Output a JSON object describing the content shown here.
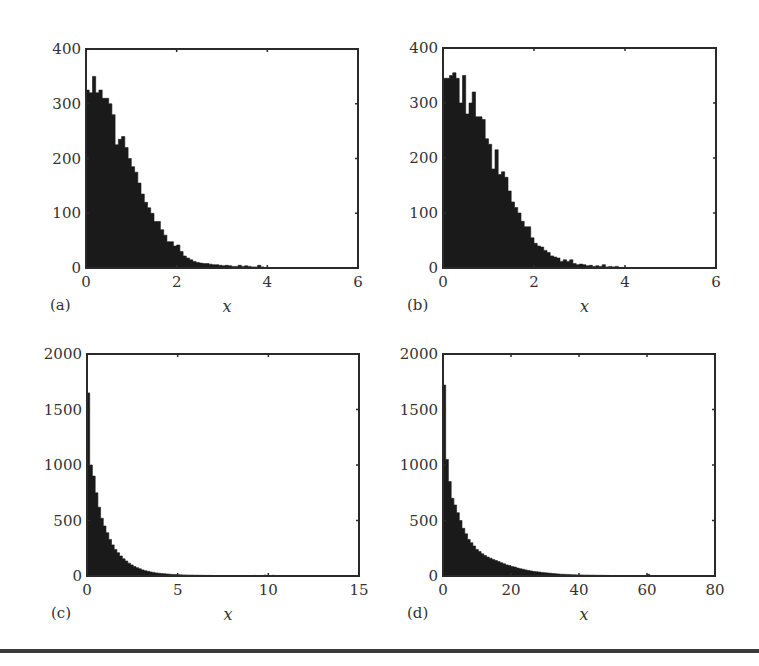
{
  "figure": {
    "bottom_rule_color": "#3a3a3a",
    "bar_color": "#1a1a1a"
  },
  "chart_data": [
    {
      "id": "a",
      "type": "bar",
      "panel_label": "(a)",
      "title": "",
      "xlabel": "x",
      "ylabel": "",
      "xlim": [
        0,
        6
      ],
      "ylim": [
        0,
        400
      ],
      "xticks": [
        "0",
        "2",
        "4",
        "6"
      ],
      "yticks": [
        "0",
        "100",
        "200",
        "300",
        "400"
      ],
      "grid": false,
      "bin_width": 0.0714,
      "bin_start": 0,
      "values": [
        325,
        320,
        350,
        320,
        325,
        310,
        310,
        300,
        280,
        225,
        235,
        240,
        220,
        200,
        185,
        175,
        155,
        135,
        120,
        110,
        100,
        85,
        85,
        70,
        60,
        48,
        48,
        40,
        42,
        30,
        22,
        18,
        15,
        12,
        10,
        9,
        8,
        8,
        7,
        6,
        6,
        5,
        4,
        5,
        4,
        3,
        3,
        5,
        3,
        4,
        3,
        2,
        2,
        5,
        2,
        1,
        1,
        1,
        1,
        0,
        0,
        0,
        0,
        0,
        0,
        0,
        0,
        0,
        0,
        0,
        0,
        0,
        0,
        0,
        0,
        0,
        0,
        0,
        0,
        0,
        0,
        0,
        0,
        0
      ]
    },
    {
      "id": "b",
      "type": "bar",
      "panel_label": "(b)",
      "title": "",
      "xlabel": "x",
      "ylabel": "",
      "xlim": [
        0,
        6
      ],
      "ylim": [
        0,
        400
      ],
      "xticks": [
        "0",
        "2",
        "4",
        "6"
      ],
      "yticks": [
        "0",
        "100",
        "200",
        "300",
        "400"
      ],
      "grid": false,
      "bin_width": 0.0714,
      "bin_start": 0,
      "values": [
        345,
        345,
        350,
        355,
        345,
        300,
        350,
        280,
        300,
        320,
        275,
        275,
        270,
        235,
        225,
        180,
        215,
        170,
        175,
        165,
        140,
        120,
        110,
        100,
        85,
        75,
        75,
        55,
        45,
        40,
        38,
        32,
        28,
        22,
        20,
        18,
        12,
        15,
        12,
        15,
        8,
        6,
        7,
        6,
        4,
        5,
        3,
        4,
        3,
        6,
        2,
        3,
        2,
        3,
        1,
        1,
        1,
        0,
        0,
        0,
        0,
        0,
        0,
        0,
        0,
        0,
        0,
        0,
        0,
        0,
        0,
        0,
        0,
        0,
        0,
        0,
        0,
        0,
        0,
        0,
        0,
        0,
        0,
        0
      ]
    },
    {
      "id": "c",
      "type": "bar",
      "panel_label": "(c)",
      "title": "",
      "xlabel": "x",
      "ylabel": "",
      "xlim": [
        0,
        15
      ],
      "ylim": [
        0,
        2000
      ],
      "xticks": [
        "0",
        "5",
        "10",
        "15"
      ],
      "yticks": [
        "0",
        "500",
        "1000",
        "1500",
        "2000"
      ],
      "grid": false,
      "bin_width": 0.15,
      "bin_start": 0,
      "values": [
        1650,
        1000,
        900,
        750,
        620,
        520,
        450,
        390,
        330,
        280,
        240,
        210,
        180,
        155,
        135,
        115,
        100,
        85,
        75,
        65,
        55,
        48,
        42,
        36,
        32,
        28,
        25,
        22,
        20,
        18,
        16,
        14,
        13,
        12,
        11,
        10,
        9,
        8,
        8,
        7,
        7,
        6,
        6,
        5,
        5,
        5,
        4,
        4,
        4,
        3,
        3,
        3,
        3,
        3,
        2,
        2,
        2,
        2,
        2,
        2,
        2,
        5,
        1,
        1,
        1,
        8,
        1,
        1,
        6,
        1,
        1,
        1,
        1,
        0,
        0,
        0,
        0,
        0,
        0,
        0,
        0,
        0,
        0,
        0,
        0,
        0,
        0,
        0,
        0,
        0,
        0,
        0,
        0,
        0,
        0,
        0,
        0,
        0,
        0,
        0
      ]
    },
    {
      "id": "d",
      "type": "bar",
      "panel_label": "(d)",
      "title": "",
      "xlabel": "x",
      "ylabel": "",
      "xlim": [
        0,
        80
      ],
      "ylim": [
        0,
        2000
      ],
      "xticks": [
        "0",
        "20",
        "40",
        "60",
        "80"
      ],
      "yticks": [
        "0",
        "500",
        "1000",
        "1500",
        "2000"
      ],
      "grid": false,
      "bin_width": 0.8,
      "bin_start": 0,
      "values": [
        1720,
        1050,
        850,
        700,
        640,
        570,
        500,
        430,
        380,
        330,
        300,
        270,
        240,
        220,
        200,
        185,
        170,
        160,
        150,
        140,
        130,
        120,
        110,
        100,
        95,
        85,
        80,
        72,
        65,
        60,
        55,
        50,
        45,
        40,
        38,
        35,
        32,
        30,
        27,
        25,
        22,
        20,
        18,
        16,
        15,
        14,
        13,
        12,
        11,
        10,
        10,
        9,
        8,
        8,
        7,
        7,
        6,
        6,
        6,
        5,
        5,
        4,
        4,
        4,
        4,
        3,
        3,
        3,
        3,
        3,
        2,
        2,
        2,
        2,
        2,
        15,
        2,
        1,
        1,
        1
      ]
    }
  ]
}
